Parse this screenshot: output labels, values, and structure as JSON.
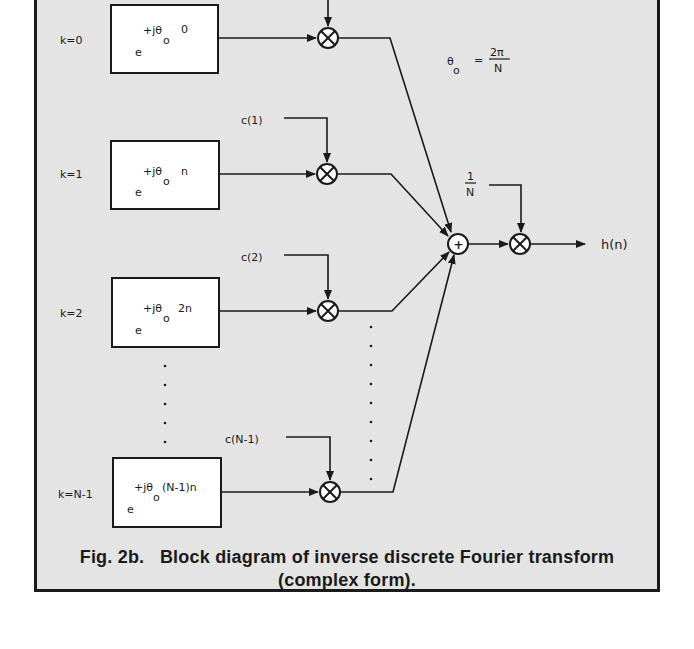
{
  "figure": {
    "caption_line1": "Fig. 2b.   Block diagram of inverse discrete Fourier transform",
    "caption_line2": "(complex form).",
    "background_color": "#e4e4e4",
    "line_color": "#1a1a1a"
  },
  "equation": {
    "theta": "θ",
    "subscript": "o",
    "equals": "=",
    "numerator": "2π",
    "denominator": "N"
  },
  "branches": [
    {
      "k_label": "k=0",
      "exp_base": "e",
      "exp_sup": "+jθ",
      "exp_sub": "o",
      "exp_tail": "0",
      "coef_label": ""
    },
    {
      "k_label": "k=1",
      "exp_base": "e",
      "exp_sup": "+jθ",
      "exp_sub": "o",
      "exp_tail": "n",
      "coef_label": "c(1)"
    },
    {
      "k_label": "k=2",
      "exp_base": "e",
      "exp_sup": "+jθ",
      "exp_sub": "o",
      "exp_tail": "2n",
      "coef_label": "c(2)"
    },
    {
      "k_label": "k=N-1",
      "exp_base": "e",
      "exp_sup": "+jθ",
      "exp_sub": "o",
      "exp_tail": "(N-1)n",
      "coef_label": "c(N-1)"
    }
  ],
  "summer": {
    "symbol": "+"
  },
  "scale": {
    "numerator": "1",
    "denominator": "N"
  },
  "output": {
    "label": "h(n)"
  }
}
